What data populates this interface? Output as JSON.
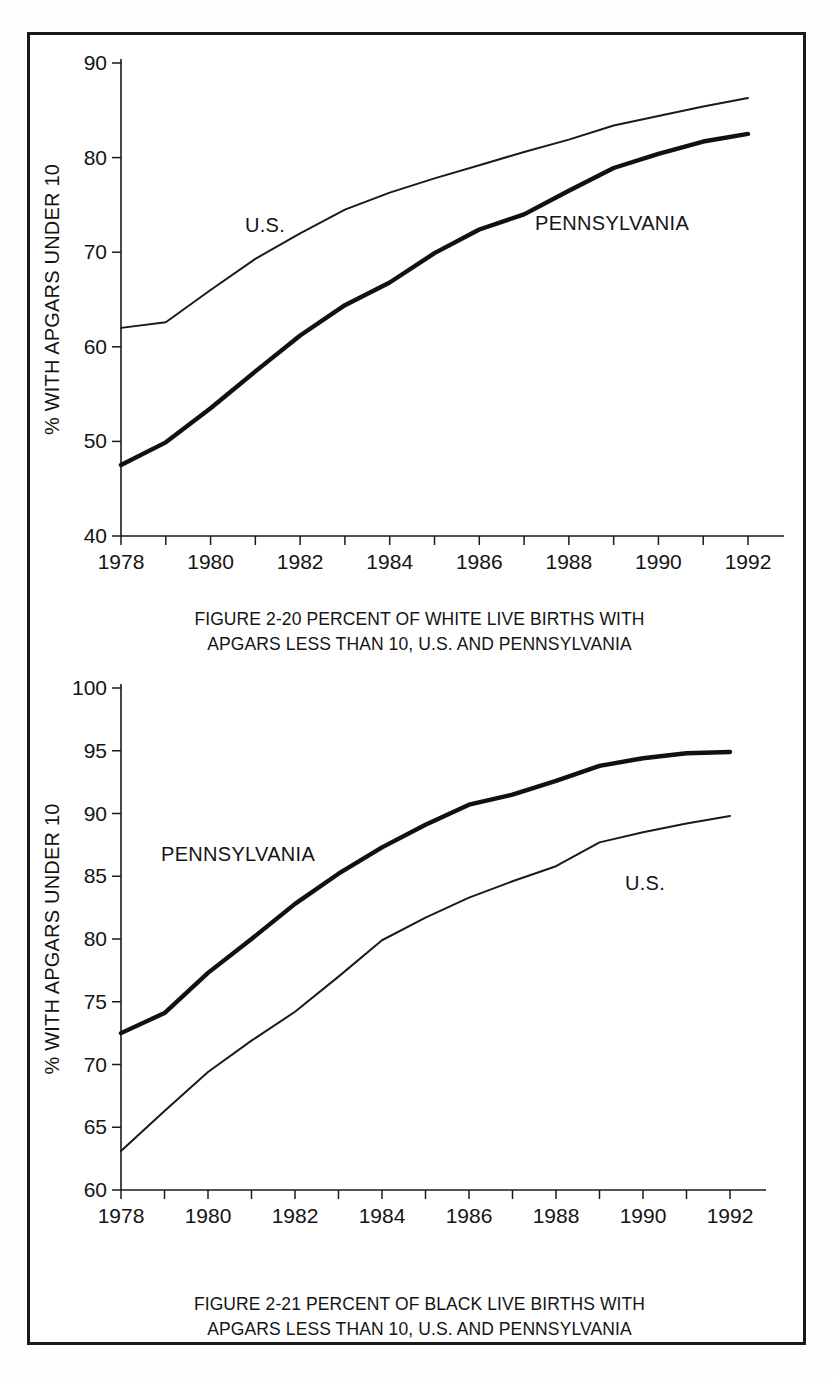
{
  "page": {
    "background_color": "#ffffff",
    "frame_color": "#1a1a1a",
    "line_color": "#1a1a1a"
  },
  "figures": [
    {
      "id": "figure-2-20",
      "caption_line1": "FIGURE 2-20  PERCENT OF WHITE LIVE BIRTHS WITH",
      "caption_line2": "APGARS LESS THAN 10, U.S. AND PENNSYLVANIA",
      "ylabel": "% WITH APGARS UNDER 10",
      "label_us": "U.S.",
      "label_pa": "PENNSYLVANIA"
    },
    {
      "id": "figure-2-21",
      "caption_line1": "FIGURE 2-21  PERCENT OF BLACK LIVE BIRTHS WITH",
      "caption_line2": "APGARS LESS THAN 10, U.S. AND PENNSYLVANIA",
      "ylabel": "% WITH APGARS UNDER 10",
      "label_us": "U.S.",
      "label_pa": "PENNSYLVANIA"
    }
  ],
  "chart_data": [
    {
      "type": "line",
      "title": "FIGURE 2-20  PERCENT OF WHITE LIVE BIRTHS WITH APGARS LESS THAN 10, U.S. AND PENNSYLVANIA",
      "xlabel": "",
      "ylabel": "% WITH APGARS UNDER 10",
      "x": [
        1978,
        1979,
        1980,
        1981,
        1982,
        1983,
        1984,
        1985,
        1986,
        1987,
        1988,
        1989,
        1990,
        1991,
        1992
      ],
      "xlim": [
        1978,
        1992
      ],
      "ylim": [
        40,
        90
      ],
      "xticks": [
        1978,
        1979,
        1980,
        1981,
        1982,
        1983,
        1984,
        1985,
        1986,
        1987,
        1988,
        1989,
        1990,
        1991,
        1992
      ],
      "xticklabels": [
        "1978",
        "",
        "1980",
        "",
        "1982",
        "",
        "1984",
        "",
        "1986",
        "",
        "1988",
        "",
        "1990",
        "",
        "1992"
      ],
      "yticks": [
        40,
        50,
        60,
        70,
        80,
        90
      ],
      "yticklabels": [
        "40",
        "50",
        "60",
        "70",
        "80",
        "90"
      ],
      "grid": false,
      "legend": "inline-annotations",
      "series": [
        {
          "name": "U.S.",
          "style": "thin",
          "values": [
            62.0,
            62.6,
            66.0,
            69.3,
            72.0,
            74.5,
            76.3,
            77.8,
            79.2,
            80.6,
            81.9,
            83.4,
            84.4,
            85.4,
            86.3
          ]
        },
        {
          "name": "PENNSYLVANIA",
          "style": "thick",
          "values": [
            47.5,
            49.9,
            53.5,
            57.4,
            61.2,
            64.4,
            66.8,
            69.9,
            72.4,
            74.0,
            76.5,
            78.9,
            80.4,
            81.7,
            82.5
          ]
        }
      ]
    },
    {
      "type": "line",
      "title": "FIGURE 2-21  PERCENT OF BLACK LIVE BIRTHS WITH APGARS LESS THAN 10, U.S. AND PENNSYLVANIA",
      "xlabel": "",
      "ylabel": "% WITH APGARS UNDER 10",
      "x": [
        1978,
        1979,
        1980,
        1981,
        1982,
        1983,
        1984,
        1985,
        1986,
        1987,
        1988,
        1989,
        1990,
        1991,
        1992
      ],
      "xlim": [
        1978,
        1992
      ],
      "ylim": [
        60,
        100
      ],
      "xticks": [
        1978,
        1979,
        1980,
        1981,
        1982,
        1983,
        1984,
        1985,
        1986,
        1987,
        1988,
        1989,
        1990,
        1991,
        1992
      ],
      "xticklabels": [
        "1978",
        "",
        "1980",
        "",
        "1982",
        "",
        "1984",
        "",
        "1986",
        "",
        "1988",
        "",
        "1990",
        "",
        "1992"
      ],
      "yticks": [
        60,
        65,
        70,
        75,
        80,
        85,
        90,
        95,
        100
      ],
      "yticklabels": [
        "60",
        "65",
        "70",
        "75",
        "80",
        "85",
        "90",
        "95",
        "100"
      ],
      "grid": false,
      "legend": "inline-annotations",
      "series": [
        {
          "name": "PENNSYLVANIA",
          "style": "thick",
          "values": [
            72.5,
            74.1,
            77.3,
            80.0,
            82.8,
            85.2,
            87.3,
            89.1,
            90.7,
            91.5,
            92.6,
            93.8,
            94.4,
            94.8,
            94.9
          ]
        },
        {
          "name": "U.S.",
          "style": "thin",
          "values": [
            63.1,
            66.3,
            69.4,
            71.9,
            74.2,
            77.0,
            79.9,
            81.7,
            83.3,
            84.6,
            85.8,
            87.7,
            88.5,
            89.2,
            89.8
          ]
        }
      ]
    }
  ]
}
